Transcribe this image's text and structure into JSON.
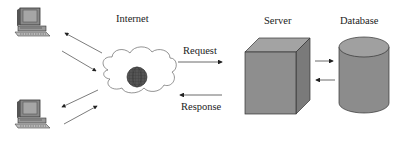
{
  "diagram": {
    "type": "client-server architecture",
    "nodes": {
      "client1": {
        "label": "",
        "icon": "desktop-computer-icon"
      },
      "client2": {
        "label": "",
        "icon": "desktop-computer-icon"
      },
      "internet": {
        "label": "Internet",
        "icon": "cloud-globe-icon"
      },
      "server": {
        "label": "Server",
        "icon": "server-box-icon"
      },
      "database": {
        "label": "Database",
        "icon": "database-cylinder-icon"
      }
    },
    "edges": {
      "request": {
        "label": "Request",
        "from": "internet",
        "to": "server"
      },
      "response": {
        "label": "Response",
        "from": "server",
        "to": "internet"
      },
      "server_to_db": {
        "label": "",
        "from": "server",
        "to": "database"
      },
      "db_to_server": {
        "label": "",
        "from": "database",
        "to": "server"
      }
    },
    "colors": {
      "box_fill": "#8c8c8c",
      "box_top": "#a8a8a8",
      "box_side": "#777777",
      "stroke": "#333333",
      "globe": "#555555"
    }
  }
}
